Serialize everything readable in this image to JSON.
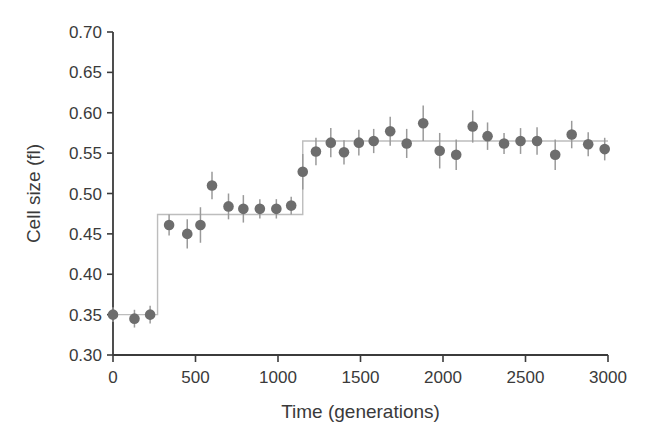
{
  "figure": {
    "background_color": "#ffffff",
    "axis_color": "#3b3b3b",
    "marker_color": "#6d6d6d",
    "errorbar_color": "#9a9a9a",
    "stepline_color": "#bdbdbd",
    "tick_label_color": "#3a3a3a"
  },
  "chart_data": {
    "type": "scatter",
    "title": "",
    "xlabel": "Time (generations)",
    "ylabel": "Cell size (fl)",
    "xlim": [
      0,
      3000
    ],
    "ylim": [
      0.3,
      0.7
    ],
    "xticks": [
      0,
      500,
      1000,
      1500,
      2000,
      2500,
      3000
    ],
    "xtick_labels": [
      "0",
      "500",
      "1000",
      "1500",
      "2000",
      "2500",
      "3000"
    ],
    "yticks": [
      0.3,
      0.35,
      0.4,
      0.45,
      0.5,
      0.55,
      0.6,
      0.65,
      0.7
    ],
    "ytick_labels": [
      "0.30",
      "0.35",
      "0.40",
      "0.45",
      "0.50",
      "0.55",
      "0.60",
      "0.65",
      "0.70"
    ],
    "grid": false,
    "legend": false,
    "marker": "filled-circle",
    "has_error_bars": true,
    "has_step_line": true,
    "x": [
      0,
      130,
      225,
      340,
      450,
      530,
      600,
      700,
      790,
      890,
      990,
      1080,
      1150,
      1230,
      1320,
      1400,
      1490,
      1580,
      1680,
      1780,
      1880,
      1980,
      2080,
      2180,
      2270,
      2370,
      2470,
      2570,
      2680,
      2780,
      2880,
      2980
    ],
    "y": [
      0.35,
      0.345,
      0.35,
      0.461,
      0.45,
      0.461,
      0.51,
      0.484,
      0.481,
      0.481,
      0.481,
      0.485,
      0.527,
      0.552,
      0.563,
      0.551,
      0.563,
      0.565,
      0.577,
      0.562,
      0.587,
      0.553,
      0.548,
      0.583,
      0.571,
      0.562,
      0.565,
      0.565,
      0.548,
      0.573,
      0.561,
      0.555
    ],
    "yerr": [
      0.009,
      0.011,
      0.011,
      0.013,
      0.018,
      0.022,
      0.017,
      0.016,
      0.017,
      0.012,
      0.012,
      0.011,
      0.022,
      0.017,
      0.018,
      0.015,
      0.016,
      0.015,
      0.018,
      0.018,
      0.022,
      0.022,
      0.019,
      0.02,
      0.017,
      0.013,
      0.016,
      0.017,
      0.019,
      0.017,
      0.015,
      0.014
    ],
    "step_line": {
      "description": "piecewise-constant fitted level overlaying the points",
      "breakpoints": [
        0,
        270,
        1150,
        3000
      ],
      "levels": [
        0.35,
        0.474,
        0.565
      ]
    }
  }
}
